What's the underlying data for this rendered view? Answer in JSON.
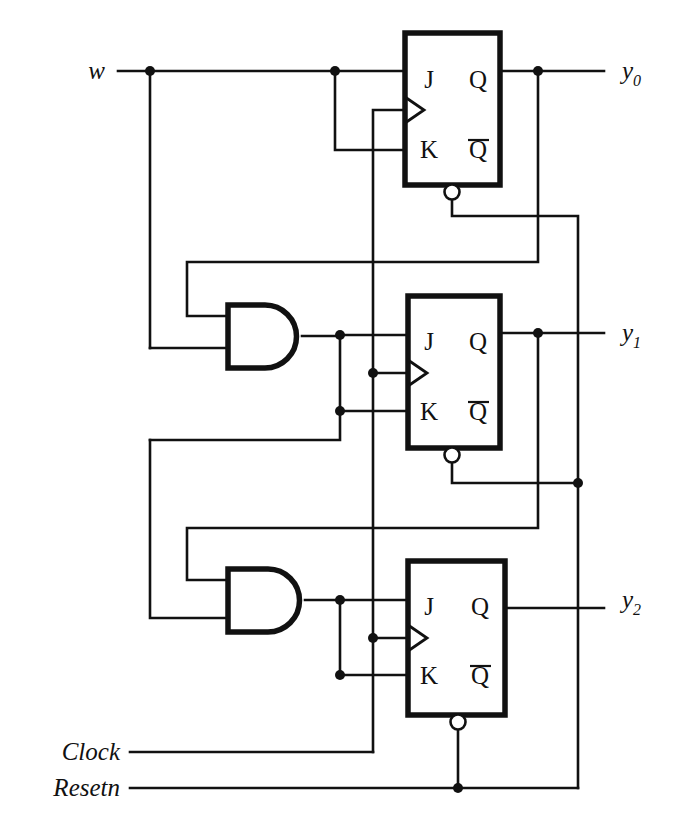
{
  "diagram": {
    "colors": {
      "ink": "#111111",
      "background": "#ffffff"
    },
    "inputs": [
      {
        "id": "w",
        "label": "w",
        "x": 95,
        "y": 79
      },
      {
        "id": "clock",
        "label": "Clock",
        "x": 120,
        "y": 760
      },
      {
        "id": "resetn",
        "label": "Resetn",
        "x": 120,
        "y": 796
      }
    ],
    "outputs": [
      {
        "id": "y0",
        "base": "y",
        "sub": "0",
        "x": 622,
        "y": 79
      },
      {
        "id": "y1",
        "base": "y",
        "sub": "1",
        "x": 622,
        "y": 341
      },
      {
        "id": "y2",
        "base": "y",
        "sub": "2",
        "x": 622,
        "y": 608
      }
    ],
    "flipflops": [
      {
        "id": "ff0",
        "type": "JK",
        "x": 405,
        "y": 33,
        "w": 95,
        "h": 152,
        "pins": {
          "j": "J",
          "k": "K",
          "q": "Q",
          "qbar": "Q"
        },
        "clock_edge": "triggered",
        "reset_active_low": true
      },
      {
        "id": "ff1",
        "type": "JK",
        "x": 408,
        "y": 296,
        "w": 92,
        "h": 152,
        "pins": {
          "j": "J",
          "k": "K",
          "q": "Q",
          "qbar": "Q"
        },
        "clock_edge": "triggered",
        "reset_active_low": true
      },
      {
        "id": "ff2",
        "type": "JK",
        "x": 408,
        "y": 561,
        "w": 97,
        "h": 154,
        "pins": {
          "j": "J",
          "k": "K",
          "q": "Q",
          "qbar": "Q"
        },
        "clock_edge": "triggered",
        "reset_active_low": true
      }
    ],
    "gates": [
      {
        "id": "and1",
        "type": "AND",
        "x": 228,
        "y": 305,
        "w": 74,
        "h": 63
      },
      {
        "id": "and2",
        "type": "AND",
        "x": 228,
        "y": 569,
        "w": 77,
        "h": 63
      }
    ],
    "junction_dots": [
      {
        "x": 150,
        "y": 71
      },
      {
        "x": 335,
        "y": 71
      },
      {
        "x": 538,
        "y": 71
      },
      {
        "x": 340,
        "y": 335
      },
      {
        "x": 340,
        "y": 411
      },
      {
        "x": 373,
        "y": 373
      },
      {
        "x": 538,
        "y": 333
      },
      {
        "x": 578,
        "y": 483
      },
      {
        "x": 340,
        "y": 600
      },
      {
        "x": 340,
        "y": 675
      },
      {
        "x": 373,
        "y": 638
      },
      {
        "x": 458,
        "y": 788
      }
    ],
    "pin_labels": [
      {
        "text": "J",
        "x": 429,
        "y": 88
      },
      {
        "text": "K",
        "x": 429,
        "y": 158
      },
      {
        "text": "Q",
        "x": 478,
        "y": 88
      },
      {
        "text": "Q",
        "x": 478,
        "y": 158,
        "overbar": true
      },
      {
        "text": "J",
        "x": 429,
        "y": 350
      },
      {
        "text": "K",
        "x": 429,
        "y": 420
      },
      {
        "text": "Q",
        "x": 478,
        "y": 350
      },
      {
        "text": "Q",
        "x": 478,
        "y": 420,
        "overbar": true
      },
      {
        "text": "J",
        "x": 429,
        "y": 615
      },
      {
        "text": "K",
        "x": 429,
        "y": 684
      },
      {
        "text": "Q",
        "x": 480,
        "y": 615
      },
      {
        "text": "Q",
        "x": 480,
        "y": 684,
        "overbar": true
      }
    ]
  }
}
